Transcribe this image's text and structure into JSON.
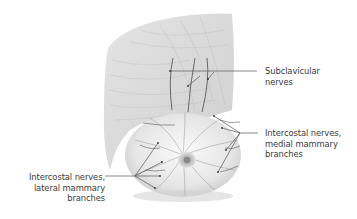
{
  "figure": {
    "colors": {
      "background": "#ffffff",
      "tissue": "#d9d9d9",
      "tissue_dark": "#b5b5b5",
      "nerve": "#4a4a4a",
      "leader_line": "#555555",
      "label_text": "#3a3a3a"
    }
  },
  "labels": {
    "subclavicular": {
      "lines": [
        "Subclavicular",
        "nerves"
      ]
    },
    "medial": {
      "lines": [
        "Intercostal nerves,",
        "medial mammary",
        "branches"
      ]
    },
    "lateral": {
      "lines": [
        "Intercostal nerves,",
        "lateral mammary",
        "branches"
      ]
    }
  }
}
